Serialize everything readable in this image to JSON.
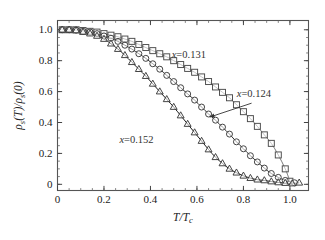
{
  "chart_data": {
    "type": "scatter",
    "title": "",
    "xlabel": "T/Tc",
    "ylabel": "rho_s(T)/rho_s(0)",
    "xlabel_display": "T/T",
    "xlabel_sub": "c",
    "ylabel_num": "(T)",
    "ylabel_den": "(0)",
    "ylabel_rho": "ρ",
    "ylabel_sub": "s",
    "xlim": [
      0,
      1.08
    ],
    "ylim": [
      -0.04,
      1.06
    ],
    "xticks": [
      0,
      0.2,
      0.4,
      0.6,
      0.8,
      1.0
    ],
    "xticklabels": [
      "0",
      "0.2",
      "0.4",
      "0.6",
      "0.8",
      "1.0"
    ],
    "yticks": [
      0,
      0.2,
      0.4,
      0.6,
      0.8,
      1.0
    ],
    "yticklabels": [
      "0",
      "0.2",
      "0.4",
      "0.6",
      "0.8",
      "1.0"
    ],
    "xminor_step": 0.05,
    "yminor_step": 0.05,
    "grid": false,
    "legend_position": "inline-annotations",
    "series": [
      {
        "name": "x=0.131",
        "marker": "square",
        "marker_open": true,
        "color": "#4a4a4a",
        "line_color": "#7a7a7a",
        "x": [
          0.02,
          0.05,
          0.08,
          0.11,
          0.14,
          0.17,
          0.2,
          0.23,
          0.26,
          0.29,
          0.32,
          0.35,
          0.38,
          0.41,
          0.44,
          0.47,
          0.5,
          0.53,
          0.56,
          0.59,
          0.62,
          0.65,
          0.68,
          0.71,
          0.74,
          0.77,
          0.8,
          0.83,
          0.86,
          0.89,
          0.92,
          0.95,
          0.98,
          1.0
        ],
        "y": [
          1.0,
          1.0,
          1.0,
          0.995,
          0.99,
          0.985,
          0.975,
          0.965,
          0.955,
          0.94,
          0.925,
          0.905,
          0.885,
          0.865,
          0.845,
          0.825,
          0.8,
          0.775,
          0.75,
          0.725,
          0.695,
          0.665,
          0.63,
          0.595,
          0.56,
          0.515,
          0.47,
          0.425,
          0.375,
          0.32,
          0.265,
          0.19,
          0.1,
          0.02
        ]
      },
      {
        "name": "x=0.124",
        "marker": "circle",
        "marker_open": true,
        "color": "#3a3a3a",
        "line_color": "#2a2a2a",
        "x": [
          0.02,
          0.05,
          0.08,
          0.11,
          0.14,
          0.17,
          0.2,
          0.23,
          0.26,
          0.29,
          0.32,
          0.35,
          0.38,
          0.41,
          0.44,
          0.47,
          0.5,
          0.53,
          0.56,
          0.59,
          0.62,
          0.65,
          0.68,
          0.71,
          0.74,
          0.77,
          0.8,
          0.83,
          0.86,
          0.89,
          0.92,
          0.95,
          0.98,
          1.02
        ],
        "y": [
          1.0,
          1.0,
          0.998,
          0.99,
          0.985,
          0.975,
          0.96,
          0.945,
          0.925,
          0.9,
          0.875,
          0.845,
          0.815,
          0.78,
          0.745,
          0.705,
          0.665,
          0.625,
          0.585,
          0.545,
          0.5,
          0.455,
          0.415,
          0.37,
          0.325,
          0.275,
          0.23,
          0.185,
          0.145,
          0.105,
          0.07,
          0.045,
          0.025,
          0.01
        ]
      },
      {
        "name": "x=0.152",
        "marker": "triangle",
        "marker_open": true,
        "color": "#3a3a3a",
        "line_color": "#1a1a1a",
        "x": [
          0.02,
          0.05,
          0.08,
          0.11,
          0.14,
          0.17,
          0.2,
          0.23,
          0.26,
          0.29,
          0.32,
          0.35,
          0.38,
          0.41,
          0.44,
          0.47,
          0.5,
          0.53,
          0.56,
          0.59,
          0.62,
          0.65,
          0.68,
          0.71,
          0.74,
          0.77,
          0.8,
          0.83,
          0.86,
          0.89,
          0.92,
          0.95,
          0.98,
          1.01,
          1.04
        ],
        "y": [
          1.0,
          1.0,
          0.995,
          0.985,
          0.975,
          0.96,
          0.94,
          0.91,
          0.875,
          0.835,
          0.79,
          0.745,
          0.7,
          0.65,
          0.6,
          0.55,
          0.5,
          0.445,
          0.39,
          0.335,
          0.28,
          0.225,
          0.175,
          0.135,
          0.1,
          0.075,
          0.055,
          0.04,
          0.03,
          0.025,
          0.018,
          0.012,
          0.008,
          0.005,
          0.01
        ]
      }
    ],
    "annotations": [
      {
        "text": "x=0.131",
        "x": 0.565,
        "y": 0.815,
        "has_arrow": false
      },
      {
        "text": "x=0.124",
        "x": 0.845,
        "y": 0.565,
        "has_arrow": true,
        "arrow_from_x": 0.835,
        "arrow_from_y": 0.525,
        "arrow_to_x": 0.655,
        "arrow_to_y": 0.435
      },
      {
        "text": "x=0.152",
        "x": 0.34,
        "y": 0.265,
        "has_arrow": false
      }
    ]
  }
}
